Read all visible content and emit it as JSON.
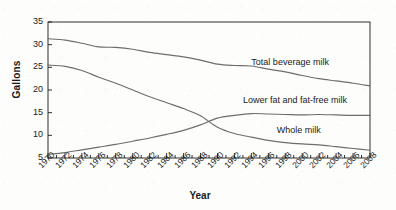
{
  "chart_data": {
    "type": "line",
    "title": "",
    "xlabel": "Year",
    "ylabel": "Gallons",
    "xlim": [
      1970,
      2008
    ],
    "ylim": [
      5,
      35
    ],
    "yticks": [
      5,
      10,
      15,
      20,
      25,
      30,
      35
    ],
    "grid": false,
    "legend_position": "inline-annotations",
    "x": [
      1970,
      1972,
      1974,
      1976,
      1978,
      1980,
      1982,
      1984,
      1986,
      1988,
      1990,
      1992,
      1994,
      1996,
      1998,
      2000,
      2002,
      2004,
      2006,
      2008
    ],
    "series": [
      {
        "name": "Total beverage milk",
        "values": [
          31.3,
          31.0,
          30.3,
          29.5,
          29.4,
          29.0,
          28.3,
          27.8,
          27.3,
          26.6,
          25.7,
          25.4,
          25.3,
          24.6,
          24.0,
          23.2,
          22.5,
          22.0,
          21.5,
          20.9
        ]
      },
      {
        "name": "Whole milk",
        "values": [
          25.5,
          25.2,
          24.3,
          22.8,
          21.5,
          20.0,
          18.5,
          17.2,
          15.9,
          14.3,
          11.8,
          10.4,
          9.6,
          8.9,
          8.4,
          8.1,
          7.9,
          7.5,
          7.1,
          6.7
        ]
      },
      {
        "name": "Lower fat and fat-free milk",
        "values": [
          5.8,
          6.2,
          6.8,
          7.4,
          8.0,
          8.7,
          9.4,
          10.2,
          11.1,
          12.3,
          13.8,
          14.4,
          14.8,
          14.7,
          14.6,
          14.5,
          14.6,
          14.5,
          14.4,
          14.4
        ]
      }
    ],
    "annotations": [
      {
        "text": "Total beverage milk",
        "x": 1994,
        "y": 26.0
      },
      {
        "text": "Lower fat and fat-free milk",
        "x": 1993,
        "y": 17.6
      },
      {
        "text": "Whole milk",
        "x": 1997,
        "y": 11.0
      }
    ],
    "xticklabels": [
      "1970",
      "1972",
      "1974",
      "1976",
      "1978",
      "1980",
      "1982",
      "1984",
      "1986",
      "1988",
      "1990",
      "1992",
      "1994",
      "1996",
      "1998",
      "2000",
      "2002",
      "2004",
      "2006",
      "2008"
    ],
    "yticklabels": [
      "5",
      "10",
      "15",
      "20",
      "25",
      "30",
      "35"
    ],
    "line_color": "#6d6d6d",
    "axis_color": "#1a1a1a",
    "background_color": "#fdfdfb"
  }
}
